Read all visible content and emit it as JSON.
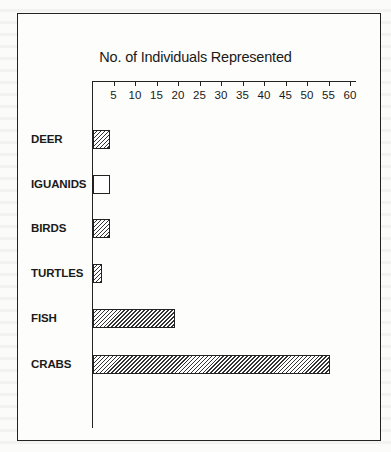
{
  "chart_data": {
    "type": "bar",
    "orientation": "horizontal",
    "title": "No. of Individuals Represented",
    "xlabel": "No. of Individuals Represented",
    "ylabel": "",
    "xlim": [
      0,
      62
    ],
    "x_ticks": [
      5,
      10,
      15,
      20,
      25,
      30,
      35,
      40,
      45,
      50,
      55,
      60
    ],
    "axis_position": "top",
    "grid": false,
    "legend": null,
    "categories": [
      "DEER",
      "IGUANIDS",
      "BIRDS",
      "TURTLES",
      "FISH",
      "CRABS"
    ],
    "values": [
      4,
      4,
      4,
      2,
      19,
      55
    ],
    "fill_patterns": [
      "hatched",
      "empty",
      "hatched",
      "hatched",
      "hatched",
      "hatched"
    ]
  },
  "title": "No. of Individuals Represented",
  "ticks": [
    "5",
    "10",
    "15",
    "20",
    "25",
    "30",
    "35",
    "40",
    "45",
    "50",
    "55",
    "60"
  ],
  "categories": [
    "DEER",
    "IGUANIDS",
    "BIRDS",
    "TURTLES",
    "FISH",
    "CRABS"
  ]
}
